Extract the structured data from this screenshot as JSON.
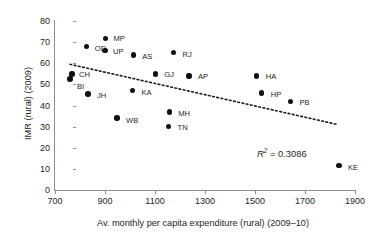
{
  "chart_data": {
    "type": "scatter",
    "title": "",
    "xlabel": "Av. monthly per capita expenditure (rural) (2009–10)",
    "ylabel": "IMR (rural) (2009)",
    "xlim": [
      700,
      1900
    ],
    "ylim": [
      0,
      80
    ],
    "xticks": [
      700,
      900,
      1100,
      1300,
      1500,
      1700,
      1900
    ],
    "yticks": [
      0,
      10,
      20,
      30,
      40,
      50,
      60,
      70,
      80
    ],
    "grid": false,
    "legend": false,
    "annotations": [
      {
        "name": "r-squared",
        "text": "R2 = 0.3086",
        "r_symbol": "R",
        "superscript": "2",
        "equals_value": " = 0.3086",
        "x": 1500,
        "y": 21
      }
    ],
    "trendline": {
      "style": "dotted",
      "color": "#1a1a1a",
      "x_start": 760,
      "y_start": 59.5,
      "x_end": 1830,
      "y_end": 31.0
    },
    "points": [
      {
        "label": "BI",
        "x": 760,
        "y": 52.5,
        "label_dx": 7,
        "label_dy": 7
      },
      {
        "label": "CH",
        "x": 768,
        "y": 55.0,
        "label_dx": 7,
        "label_dy": 0
      },
      {
        "label": "OD",
        "x": 827,
        "y": 68.0,
        "label_dx": 8,
        "label_dy": 2
      },
      {
        "label": "JH",
        "x": 832,
        "y": 45.5,
        "label_dx": 9,
        "label_dy": 1
      },
      {
        "label": "UP",
        "x": 900,
        "y": 66.0,
        "label_dx": 8,
        "label_dy": 0
      },
      {
        "label": "MP",
        "x": 902,
        "y": 71.8,
        "label_dx": 8,
        "label_dy": 0
      },
      {
        "label": "WB",
        "x": 948,
        "y": 34.0,
        "label_dx": 9,
        "label_dy": 2
      },
      {
        "label": "KA",
        "x": 1010,
        "y": 47.0,
        "label_dx": 9,
        "label_dy": 1
      },
      {
        "label": "AS",
        "x": 1013,
        "y": 64.0,
        "label_dx": 9,
        "label_dy": 1
      },
      {
        "label": "GJ",
        "x": 1101,
        "y": 55.0,
        "label_dx": 9,
        "label_dy": 0
      },
      {
        "label": "TN",
        "x": 1154,
        "y": 30.2,
        "label_dx": 9,
        "label_dy": 1
      },
      {
        "label": "MH",
        "x": 1157,
        "y": 37.0,
        "label_dx": 9,
        "label_dy": 1
      },
      {
        "label": "RJ",
        "x": 1174,
        "y": 65.0,
        "label_dx": 9,
        "label_dy": 1
      },
      {
        "label": "AP",
        "x": 1236,
        "y": 54.0,
        "label_dx": 9,
        "label_dy": 0
      },
      {
        "label": "HA",
        "x": 1507,
        "y": 54.0,
        "label_dx": 9,
        "label_dy": 0
      },
      {
        "label": "HP",
        "x": 1527,
        "y": 46.0,
        "label_dx": 9,
        "label_dy": 1
      },
      {
        "label": "PB",
        "x": 1642,
        "y": 42.0,
        "label_dx": 9,
        "label_dy": 1
      },
      {
        "label": "KE",
        "x": 1836,
        "y": 11.5,
        "label_dx": 9,
        "label_dy": 1
      }
    ]
  }
}
